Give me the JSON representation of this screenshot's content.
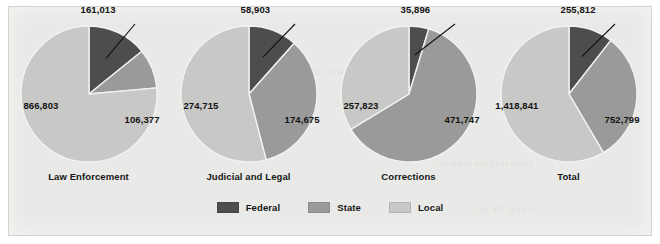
{
  "figure": {
    "background_color": "#e9e9e7",
    "bleed_text": [
      "Division",
      "the  justice",
      "system  employment",
      "of  all  levels"
    ]
  },
  "legend": {
    "position": "bottom-center",
    "items": [
      {
        "label": "Federal",
        "color": "#4d4d4d",
        "icon": "legend-swatch-icon"
      },
      {
        "label": "State",
        "color": "#9a9a9a",
        "icon": "legend-swatch-icon"
      },
      {
        "label": "Local",
        "color": "#c8c8c6",
        "icon": "legend-swatch-icon"
      }
    ]
  },
  "chart_data": {
    "type": "pie",
    "title": "",
    "subtitle": "",
    "xlabel": "",
    "ylabel": "",
    "grid": false,
    "legend_position": "bottom-center",
    "series_names": [
      "Federal",
      "State",
      "Local"
    ],
    "colors": [
      "#4d4d4d",
      "#9a9a9a",
      "#c8c8c6"
    ],
    "charts": [
      {
        "title": "Law Enforcement",
        "labels": [
          "Federal",
          "State",
          "Local"
        ],
        "values": [
          161013,
          106377,
          866803
        ],
        "value_text": [
          "161,013",
          "106,377",
          "866,803"
        ],
        "total": 1134193,
        "percents": [
          14.2,
          9.4,
          76.4
        ],
        "callout_index": 0
      },
      {
        "title": "Judicial and Legal",
        "labels": [
          "Federal",
          "State",
          "Local"
        ],
        "values": [
          58903,
          174675,
          274715
        ],
        "value_text": [
          "58,903",
          "174,675",
          "274,715"
        ],
        "total": 508293,
        "percents": [
          11.6,
          34.4,
          54.0
        ],
        "callout_index": 0
      },
      {
        "title": "Corrections",
        "labels": [
          "Federal",
          "State",
          "Local"
        ],
        "values": [
          35896,
          471747,
          257823
        ],
        "value_text": [
          "35,896",
          "471,747",
          "257,823"
        ],
        "total": 765466,
        "percents": [
          4.7,
          61.6,
          33.7
        ],
        "callout_index": 0
      },
      {
        "title": "Total",
        "labels": [
          "Federal",
          "State",
          "Local"
        ],
        "values": [
          255812,
          752799,
          1418841
        ],
        "value_text": [
          "255,812",
          "752,799",
          "1,418,841"
        ],
        "total": 2427452,
        "percents": [
          10.5,
          31.0,
          58.4
        ],
        "callout_index": 0
      }
    ]
  }
}
